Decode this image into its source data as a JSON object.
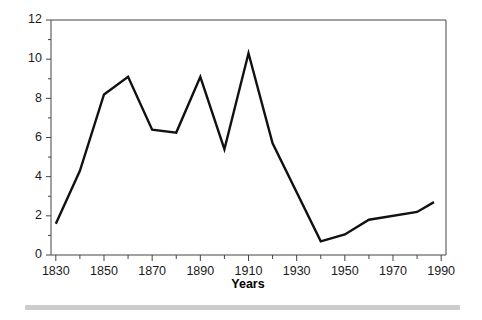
{
  "chart_data": {
    "type": "line",
    "title": "",
    "xlabel": "Years",
    "ylabel": "",
    "xlim": [
      1828,
      1992
    ],
    "ylim": [
      0,
      12
    ],
    "grid": false,
    "legend": null,
    "x_ticks_major": [
      1830,
      1850,
      1870,
      1890,
      1910,
      1930,
      1950,
      1970,
      1990
    ],
    "x_tick_labels": [
      "1830",
      "1850",
      "1870",
      "1890",
      "1910",
      "1930",
      "1950",
      "1970",
      "1990"
    ],
    "x_ticks_minor": [
      1840,
      1860,
      1880,
      1900,
      1920,
      1940,
      1960,
      1980
    ],
    "y_ticks_major": [
      0,
      2,
      4,
      6,
      8,
      10,
      12
    ],
    "y_tick_labels": [
      "0",
      "2",
      "4",
      "6",
      "8",
      "10",
      "12"
    ],
    "y_ticks_minor": [
      1,
      3,
      5,
      7,
      9,
      11
    ],
    "series": [
      {
        "name": "series-1",
        "color": "#111111",
        "x": [
          1830,
          1840,
          1850,
          1860,
          1870,
          1880,
          1890,
          1900,
          1910,
          1920,
          1940,
          1950,
          1960,
          1980,
          1987
        ],
        "values": [
          1.6,
          4.3,
          8.2,
          9.1,
          6.4,
          6.25,
          9.1,
          5.4,
          10.3,
          5.7,
          0.7,
          1.05,
          1.8,
          2.2,
          2.7
        ]
      }
    ]
  },
  "footer": {
    "bar_color": "#cccccc"
  }
}
